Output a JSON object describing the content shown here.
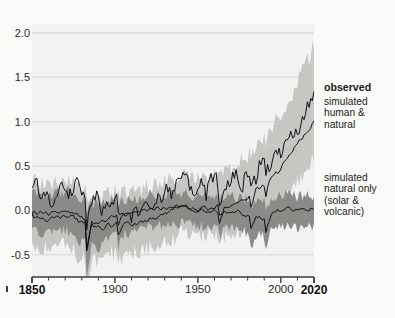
{
  "chart_data": {
    "type": "line",
    "title": "",
    "xlabel": "",
    "ylabel": "°C",
    "xlim": [
      1850,
      2020
    ],
    "ylim": [
      -0.75,
      2.1
    ],
    "grid": true,
    "legend_position": "right-inline",
    "y_ticks": [
      2.0,
      1.5,
      1.0,
      0.5,
      0.0,
      -0.5
    ],
    "y_tick_labels": [
      "2.0",
      "1.5",
      "1.0",
      "0.5",
      "0.0",
      "-0.5"
    ],
    "x_ticks": [
      1850,
      1900,
      1950,
      2000,
      2020
    ],
    "x_tick_labels": [
      "1850",
      "1900",
      "1950",
      "2000",
      "2020"
    ],
    "x_minor_tick_step": 10,
    "bold_x_ticks": [
      "1850",
      "2020"
    ],
    "annotations": [
      {
        "text": "observed",
        "bold": true,
        "x": 324,
        "y": 82
      },
      {
        "text": "simulated\nhuman &\nnatural",
        "bold": false,
        "x": 324,
        "y": 96
      },
      {
        "text": "simulated\nnatural only\n(solar &\nvolcanic)",
        "bold": false,
        "x": 324,
        "y": 172
      }
    ],
    "colors": {
      "plot_background": "#f2f2f0",
      "page_background": "#fafaf8",
      "grid": "#d6d6d2",
      "band_human_natural": "#c6c6c2",
      "band_natural_only": "#8a8a86",
      "line_observed": "#111111",
      "line_simulated_human_natural": "#111111",
      "line_simulated_natural_only": "#111111",
      "axis": "#3a3a3a",
      "text": "#1a1a1a"
    },
    "series": [
      {
        "name": "observed",
        "kind": "line",
        "x": [
          1850,
          1853,
          1856,
          1859,
          1862,
          1865,
          1868,
          1871,
          1874,
          1877,
          1880,
          1883,
          1886,
          1889,
          1892,
          1895,
          1898,
          1901,
          1904,
          1907,
          1910,
          1913,
          1916,
          1919,
          1922,
          1925,
          1928,
          1931,
          1934,
          1937,
          1940,
          1943,
          1946,
          1949,
          1952,
          1955,
          1958,
          1961,
          1964,
          1967,
          1970,
          1973,
          1976,
          1979,
          1982,
          1985,
          1988,
          1991,
          1994,
          1997,
          2000,
          2003,
          2006,
          2009,
          2012,
          2015,
          2018,
          2020
        ],
        "values": [
          -0.08,
          0.02,
          -0.19,
          -0.05,
          -0.3,
          -0.14,
          0.05,
          -0.12,
          -0.12,
          0.1,
          -0.1,
          -0.19,
          -0.24,
          -0.09,
          -0.29,
          -0.23,
          -0.25,
          -0.12,
          -0.36,
          -0.35,
          -0.38,
          -0.29,
          -0.34,
          -0.22,
          -0.24,
          -0.17,
          -0.18,
          -0.07,
          -0.12,
          -0.02,
          0.09,
          0.05,
          -0.07,
          -0.09,
          0.02,
          -0.12,
          0.07,
          0.07,
          -0.18,
          -0.02,
          0.02,
          0.15,
          -0.1,
          0.12,
          0.1,
          0.06,
          0.28,
          0.25,
          0.22,
          0.41,
          0.32,
          0.56,
          0.53,
          0.59,
          0.63,
          0.86,
          0.96,
          1.02
        ]
      },
      {
        "name": "simulated human & natural",
        "kind": "line",
        "x": [
          1850,
          1860,
          1870,
          1880,
          1890,
          1900,
          1910,
          1920,
          1930,
          1940,
          1950,
          1960,
          1970,
          1980,
          1990,
          2000,
          2010,
          2020
        ],
        "values": [
          -0.06,
          -0.1,
          -0.04,
          -0.12,
          -0.2,
          -0.14,
          -0.16,
          -0.1,
          -0.04,
          0.06,
          0.0,
          0.04,
          0.02,
          0.16,
          0.3,
          0.48,
          0.74,
          0.98
        ]
      },
      {
        "name": "simulated natural only (solar & volcanic)",
        "kind": "line",
        "x": [
          1850,
          1860,
          1870,
          1880,
          1890,
          1900,
          1910,
          1920,
          1930,
          1940,
          1950,
          1960,
          1970,
          1980,
          1990,
          2000,
          2010,
          2020
        ],
        "values": [
          -0.02,
          -0.04,
          0.0,
          -0.08,
          -0.16,
          -0.04,
          -0.06,
          0.02,
          0.02,
          0.04,
          0.0,
          0.0,
          0.0,
          -0.06,
          -0.08,
          0.02,
          0.0,
          0.0
        ]
      }
    ],
    "bands": [
      {
        "name": "simulated human & natural range",
        "upper_label": "upper bound",
        "lower_label": "lower bound",
        "x": [
          1850,
          1860,
          1870,
          1880,
          1890,
          1900,
          1910,
          1920,
          1930,
          1940,
          1950,
          1960,
          1970,
          1980,
          1990,
          2000,
          2010,
          2020
        ],
        "upper": [
          0.34,
          0.3,
          0.34,
          0.26,
          0.14,
          0.22,
          0.2,
          0.26,
          0.32,
          0.42,
          0.38,
          0.42,
          0.44,
          0.62,
          0.84,
          1.1,
          1.44,
          1.86
        ],
        "lower": [
          -0.4,
          -0.44,
          -0.38,
          -0.54,
          -0.6,
          -0.46,
          -0.48,
          -0.42,
          -0.36,
          -0.26,
          -0.3,
          -0.26,
          -0.3,
          -0.2,
          -0.02,
          0.12,
          0.34,
          0.58
        ]
      },
      {
        "name": "simulated natural only range",
        "x": [
          1850,
          1860,
          1870,
          1880,
          1890,
          1900,
          1910,
          1920,
          1930,
          1940,
          1950,
          1960,
          1970,
          1980,
          1990,
          2000,
          2010,
          2020
        ],
        "upper": [
          0.2,
          0.18,
          0.22,
          0.14,
          0.04,
          0.14,
          0.12,
          0.18,
          0.18,
          0.2,
          0.16,
          0.18,
          0.16,
          0.12,
          0.1,
          0.18,
          0.16,
          0.16
        ],
        "lower": [
          -0.24,
          -0.26,
          -0.22,
          -0.36,
          -0.42,
          -0.26,
          -0.28,
          -0.18,
          -0.16,
          -0.14,
          -0.18,
          -0.18,
          -0.2,
          -0.26,
          -0.28,
          -0.16,
          -0.18,
          -0.18
        ]
      }
    ]
  },
  "axis_labels": {
    "unit": "°C"
  }
}
